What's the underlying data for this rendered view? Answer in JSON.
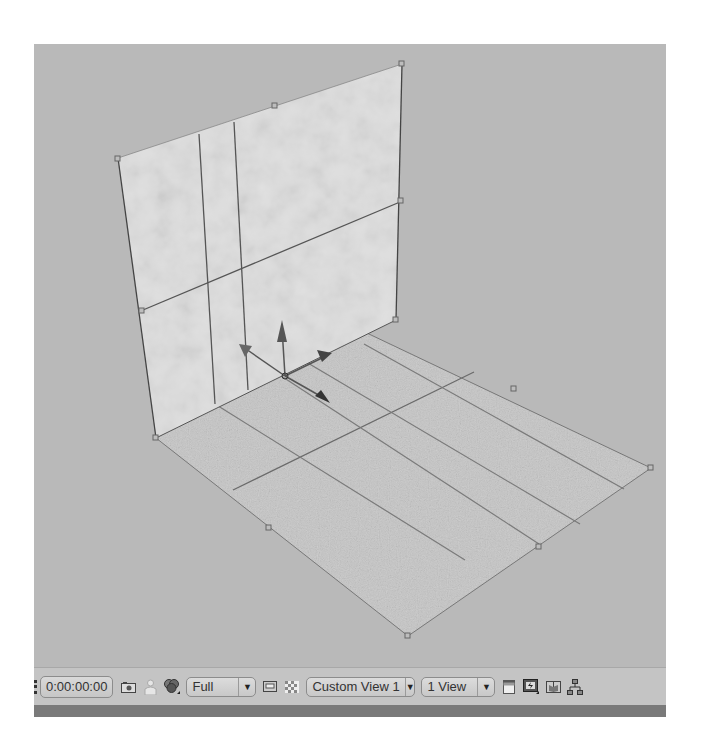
{
  "toolbar": {
    "timecode": "0:00:00:00",
    "resolution": {
      "selected": "Full"
    },
    "view_camera": {
      "selected": "Custom View 1"
    },
    "view_layout": {
      "selected": "1 View"
    },
    "icons": {
      "snapshot": "camera-snapshot-icon",
      "show_snapshot": "person-snapshot-icon",
      "channels": "rgb-channels-icon",
      "region_of_interest": "region-of-interest-icon",
      "transparency_grid": "transparency-grid-icon",
      "pixel_aspect": "pixel-aspect-icon",
      "fast_previews": "fast-previews-icon",
      "timeline": "timeline-icon",
      "flowchart": "flowchart-icon"
    }
  },
  "scene": {
    "background_color": "#b9b9b9",
    "wall_color": "#dcdcdc",
    "floor_color": "#c4c4c4",
    "gizmo": [
      "x-axis-arrow",
      "y-axis-arrow",
      "z-axis-arrow"
    ]
  }
}
